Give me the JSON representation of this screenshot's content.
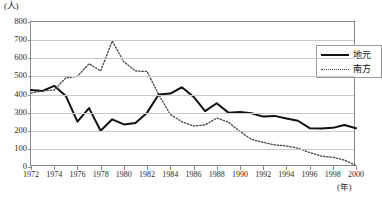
{
  "chart_data": {
    "type": "line",
    "title": "",
    "xlabel": "(年)",
    "ylabel": "(人)",
    "ylim": [
      0,
      800
    ],
    "xlim": [
      1972,
      2000
    ],
    "grid": true,
    "legend_position": "top-right",
    "ytick_labels": [
      "800",
      "700",
      "600",
      "500",
      "400",
      "300",
      "200",
      "100",
      "0"
    ],
    "ytick_values": [
      800,
      700,
      600,
      500,
      400,
      300,
      200,
      100,
      0
    ],
    "xtick_labels": [
      "1972",
      "1974",
      "1976",
      "1978",
      "1980",
      "1982",
      "1984",
      "1986",
      "1988",
      "1990",
      "1992",
      "1994",
      "1996",
      "1998",
      "2000"
    ],
    "xtick_values": [
      1972,
      1974,
      1976,
      1978,
      1980,
      1982,
      1984,
      1986,
      1988,
      1990,
      1992,
      1994,
      1996,
      1998,
      2000
    ],
    "x": [
      1972,
      1973,
      1974,
      1975,
      1976,
      1977,
      1978,
      1979,
      1980,
      1981,
      1982,
      1983,
      1984,
      1985,
      1986,
      1987,
      1988,
      1989,
      1990,
      1991,
      1992,
      1993,
      1994,
      1995,
      1996,
      1997,
      1998,
      1999,
      2000
    ],
    "series": [
      {
        "name": "地元",
        "style": "solid",
        "color": "#111111",
        "values": [
          425,
          420,
          448,
          392,
          250,
          325,
          200,
          263,
          235,
          243,
          300,
          400,
          405,
          440,
          388,
          308,
          352,
          300,
          303,
          297,
          278,
          282,
          268,
          255,
          214,
          212,
          216,
          232,
          214
        ]
      },
      {
        "name": "南方",
        "style": "dotted",
        "color": "#444444",
        "values": [
          408,
          420,
          425,
          492,
          500,
          570,
          530,
          695,
          580,
          530,
          527,
          400,
          290,
          250,
          226,
          232,
          270,
          248,
          196,
          152,
          136,
          122,
          116,
          104,
          80,
          60,
          54,
          38,
          8
        ]
      }
    ]
  },
  "axes": {
    "y_unit_label": "(人)",
    "x_unit_label": "(年)"
  },
  "legend": {
    "items": [
      {
        "label": "地元",
        "style": "solid"
      },
      {
        "label": "南方",
        "style": "dotted"
      }
    ]
  },
  "caption": {
    "text": ""
  }
}
